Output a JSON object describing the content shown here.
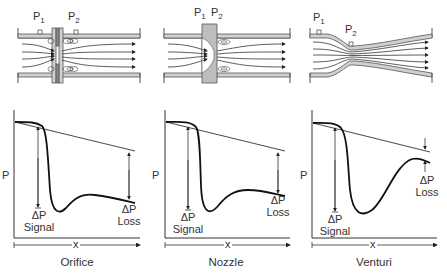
{
  "colors": {
    "line": "#222222",
    "pipe_fill": "#d0d0d0",
    "pipe_edge": "#555555",
    "background": "#ffffff"
  },
  "panels": [
    {
      "name": "Orifice",
      "caption": "Orifice",
      "taps": {
        "p1": "P",
        "p1_sub": "1",
        "p2": "P",
        "p2_sub": "2"
      },
      "axis": {
        "y_label": "P",
        "x_label": "x"
      },
      "signal": {
        "symbol": "ΔP",
        "label": "Signal"
      },
      "loss": {
        "symbol": "ΔP",
        "label": "Loss"
      }
    },
    {
      "name": "Nozzle",
      "caption": "Nozzle",
      "taps": {
        "p1": "P",
        "p1_sub": "1",
        "p2": "P",
        "p2_sub": "2"
      },
      "axis": {
        "y_label": "P",
        "x_label": "x"
      },
      "signal": {
        "symbol": "ΔP",
        "label": "Signal"
      },
      "loss": {
        "symbol": "ΔP",
        "label": "Loss"
      }
    },
    {
      "name": "Venturi",
      "caption": "Venturi",
      "taps": {
        "p1": "P",
        "p1_sub": "1",
        "p2": "P",
        "p2_sub": "2"
      },
      "axis": {
        "y_label": "P",
        "x_label": "x"
      },
      "signal": {
        "symbol": "ΔP",
        "label": "Signal"
      },
      "loss": {
        "symbol": "ΔP",
        "label": "Loss"
      }
    }
  ]
}
